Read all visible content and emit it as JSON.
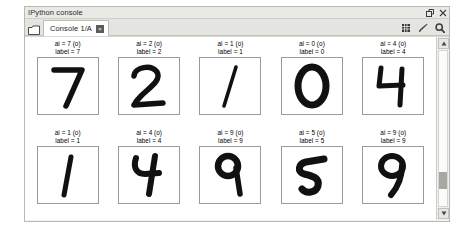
{
  "window": {
    "title": "IPython console",
    "title_buttons": [
      {
        "name": "undock-button",
        "glyph": "undock"
      },
      {
        "name": "close-button",
        "glyph": "close"
      }
    ]
  },
  "toolbar": {
    "browse_icon": "folder-browse-icon",
    "tab": {
      "label": "Console 1/A",
      "close_glyph": "×"
    },
    "icons": [
      {
        "name": "options-icon",
        "glyph": "square"
      },
      {
        "name": "brush-icon",
        "glyph": "brush"
      },
      {
        "name": "zoom-icon",
        "glyph": "magnifier"
      }
    ]
  },
  "figure": {
    "rows": [
      [
        {
          "ai_line": "ai = 7 (o)",
          "label_line": "label = 7",
          "digit": "7"
        },
        {
          "ai_line": "ai = 2 (o)",
          "label_line": "label = 2",
          "digit": "2"
        },
        {
          "ai_line": "ai = 1 (o)",
          "label_line": "label = 1",
          "digit": "1"
        },
        {
          "ai_line": "ai = 0 (o)",
          "label_line": "label = 0",
          "digit": "0"
        },
        {
          "ai_line": "ai = 4 (o)",
          "label_line": "label = 4",
          "digit": "4"
        }
      ],
      [
        {
          "ai_line": "ai = 1 (o)",
          "label_line": "label = 1",
          "digit": "1b"
        },
        {
          "ai_line": "ai = 4 (o)",
          "label_line": "label = 4",
          "digit": "4b"
        },
        {
          "ai_line": "ai = 9 (o)",
          "label_line": "label = 9",
          "digit": "9"
        },
        {
          "ai_line": "ai = 5 (o)",
          "label_line": "label = 5",
          "digit": "5"
        },
        {
          "ai_line": "ai = 9 (o)",
          "label_line": "label = 9",
          "digit": "9b"
        }
      ]
    ]
  },
  "scrollbar": {
    "up_glyph": "▲",
    "down_glyph": "▼",
    "thumb_position_pct": 78
  },
  "colors": {
    "window_bg": "#f2f2f0",
    "titlebar_bg": "#e9e9e6",
    "tab_bg": "#ffffff",
    "content_bg": "#ffffff",
    "ink": "#111111"
  }
}
